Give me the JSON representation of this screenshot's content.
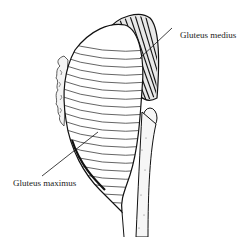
{
  "diagram": {
    "type": "anatomical-illustration",
    "labels": [
      {
        "id": "medius",
        "text": "Gluteus medius",
        "anchor": [
          172,
          22
        ],
        "target": [
          138,
          58
        ]
      },
      {
        "id": "maximus",
        "text": "Gluteus maximus",
        "anchor": [
          42,
          176
        ],
        "target": [
          98,
          132
        ]
      }
    ],
    "colors": {
      "ink": "#1a1a1a",
      "paper": "#ffffff"
    }
  }
}
